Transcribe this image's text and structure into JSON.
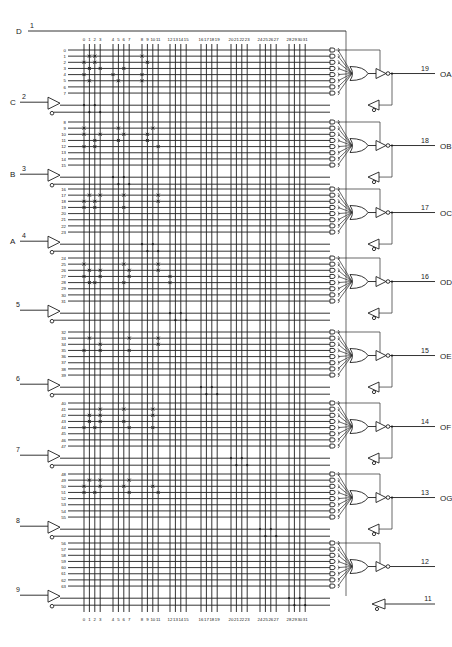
{
  "diagram": {
    "global_input": {
      "label": "D",
      "pin": "1"
    },
    "input_columns": [
      "0",
      "1",
      "2",
      "3",
      "4",
      "5",
      "6",
      "7",
      "8",
      "9",
      "10",
      "11",
      "12",
      "13",
      "14",
      "15",
      "16",
      "17",
      "18",
      "19",
      "20",
      "21",
      "22",
      "23",
      "24",
      "25",
      "26",
      "27",
      "28",
      "29",
      "30",
      "31"
    ],
    "inputs": [
      {
        "label": "C",
        "pin": "2"
      },
      {
        "label": "B",
        "pin": "3"
      },
      {
        "label": "A",
        "pin": "4"
      },
      {
        "label": "",
        "pin": "5"
      },
      {
        "label": "",
        "pin": "6"
      },
      {
        "label": "",
        "pin": "7"
      },
      {
        "label": "",
        "pin": "8"
      },
      {
        "label": "",
        "pin": "9"
      }
    ],
    "outputs": [
      {
        "label": "OA",
        "pin": "19",
        "feedback": true
      },
      {
        "label": "OB",
        "pin": "18",
        "feedback": true
      },
      {
        "label": "OC",
        "pin": "17",
        "feedback": true
      },
      {
        "label": "OD",
        "pin": "16",
        "feedback": true
      },
      {
        "label": "OE",
        "pin": "15",
        "feedback": true
      },
      {
        "label": "OF",
        "pin": "14",
        "feedback": true
      },
      {
        "label": "OG",
        "pin": "13",
        "feedback": true
      },
      {
        "label": "",
        "pin": "12",
        "feedback": false
      }
    ],
    "extra_input": {
      "label": "",
      "pin": "11"
    },
    "product_rows": [
      [
        "0",
        "1",
        "2",
        "3",
        "4",
        "5",
        "6",
        "7"
      ],
      [
        "8",
        "9",
        "10",
        "11",
        "12",
        "13",
        "14",
        "15"
      ],
      [
        "16",
        "17",
        "18",
        "19",
        "20",
        "21",
        "22",
        "23"
      ],
      [
        "24",
        "25",
        "26",
        "27",
        "28",
        "29",
        "30",
        "31"
      ],
      [
        "32",
        "33",
        "34",
        "35",
        "36",
        "37",
        "38",
        "39"
      ],
      [
        "40",
        "41",
        "42",
        "43",
        "44",
        "45",
        "46",
        "47"
      ],
      [
        "48",
        "49",
        "50",
        "51",
        "52",
        "53",
        "54",
        "55"
      ],
      [
        "56",
        "57",
        "58",
        "59",
        "60",
        "61",
        "62",
        "63"
      ]
    ],
    "fuses": [
      [
        [
          1,
          [
            2,
            3,
            9
          ]
        ],
        [
          2,
          [
            1,
            3,
            10
          ]
        ],
        [
          3,
          [
            2,
            4,
            7
          ]
        ],
        [
          4,
          [
            1,
            5,
            9
          ]
        ],
        [
          5,
          [
            2,
            6,
            9
          ]
        ]
      ],
      [
        [
          1,
          [
            1,
            6,
            11
          ]
        ],
        [
          2,
          [
            1,
            4,
            7,
            10
          ]
        ],
        [
          3,
          [
            3,
            6,
            10
          ]
        ],
        [
          4,
          [
            1,
            3,
            12
          ]
        ]
      ],
      [
        [
          1,
          [
            2,
            4,
            7,
            12
          ]
        ],
        [
          2,
          [
            1,
            3,
            12
          ]
        ],
        [
          3,
          [
            1,
            3,
            7
          ]
        ]
      ],
      [
        [
          1,
          [
            1,
            7,
            12
          ]
        ],
        [
          2,
          [
            2,
            4,
            8,
            12
          ]
        ],
        [
          3,
          [
            1,
            4,
            8,
            13
          ]
        ],
        [
          4,
          [
            2,
            3,
            7,
            13
          ]
        ]
      ],
      [
        [
          1,
          [
            2,
            8,
            12
          ]
        ],
        [
          2,
          [
            4,
            12
          ]
        ],
        [
          3,
          [
            1,
            4,
            8
          ]
        ]
      ],
      [
        [
          1,
          [
            4,
            7,
            11
          ]
        ],
        [
          2,
          [
            2,
            4,
            11
          ]
        ],
        [
          3,
          [
            2,
            4,
            7
          ]
        ],
        [
          4,
          [
            1,
            3,
            8,
            11
          ]
        ]
      ],
      [
        [
          1,
          [
            2,
            4,
            8
          ]
        ],
        [
          2,
          [
            1,
            4,
            7,
            11
          ]
        ],
        [
          3,
          [
            1,
            3,
            8,
            12
          ]
        ]
      ],
      []
    ],
    "caption": ""
  }
}
